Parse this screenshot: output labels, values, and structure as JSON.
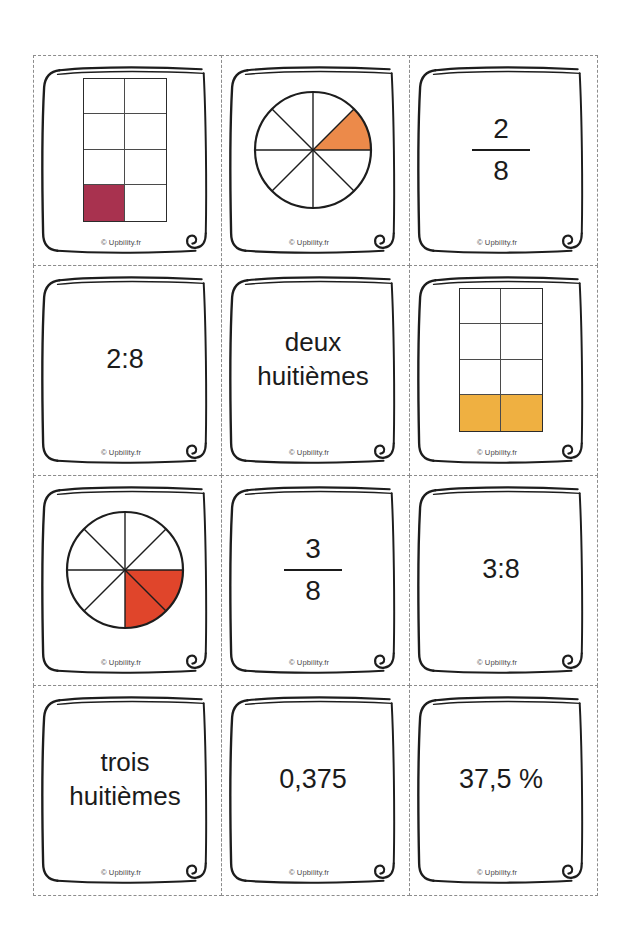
{
  "page": {
    "copyright": "© Upbility.fr",
    "background": "#ffffff",
    "cut_guide_color": "#8d8d8d",
    "ink_color": "#1b1b1b"
  },
  "palette": {
    "maroon": "#A8324F",
    "grid_orange": "#EFB041",
    "pie_orange": "#EC8A4A",
    "pie_red": "#E0452B",
    "outline": "#2c2c2c"
  },
  "cards": [
    {
      "id": "card-1",
      "kind": "rect-model",
      "name": "rectangle-model-one-eighth",
      "model": {
        "cols": 2,
        "rows": 4,
        "total": 8,
        "filled": 1,
        "filled_cells": [
          6
        ],
        "fill_color": "#A8324F",
        "width": 82,
        "height": 142
      },
      "copyright": "© Upbility.fr"
    },
    {
      "id": "card-2",
      "kind": "pie-model",
      "name": "pie-model-one-eighth",
      "model": {
        "sectors": 8,
        "filled": 1,
        "filled_sectors": [
          7
        ],
        "fill_color": "#EC8A4A",
        "radius": 58
      },
      "copyright": "© Upbility.fr"
    },
    {
      "id": "card-3",
      "kind": "fraction",
      "name": "fraction-two-eighths",
      "numerator": "2",
      "denominator": "8",
      "copyright": "© Upbility.fr"
    },
    {
      "id": "card-4",
      "kind": "text",
      "name": "ratio-two-to-eight",
      "text": "2:8",
      "copyright": "© Upbility.fr"
    },
    {
      "id": "card-5",
      "kind": "text",
      "name": "words-deux-huitiemes",
      "text": "deux\nhuitièmes",
      "copyright": "© Upbility.fr"
    },
    {
      "id": "card-6",
      "kind": "rect-model",
      "name": "rectangle-model-two-eighths",
      "model": {
        "cols": 2,
        "rows": 4,
        "total": 8,
        "filled": 2,
        "filled_cells": [
          6,
          7
        ],
        "fill_color": "#EFB041",
        "width": 82,
        "height": 142
      },
      "copyright": "© Upbility.fr"
    },
    {
      "id": "card-7",
      "kind": "pie-model",
      "name": "pie-model-two-eighths",
      "model": {
        "sectors": 8,
        "filled": 2,
        "filled_sectors": [
          0,
          1
        ],
        "fill_color": "#E0452B",
        "radius": 58
      },
      "copyright": "© Upbility.fr"
    },
    {
      "id": "card-8",
      "kind": "fraction",
      "name": "fraction-three-eighths",
      "numerator": "3",
      "denominator": "8",
      "copyright": "© Upbility.fr"
    },
    {
      "id": "card-9",
      "kind": "text",
      "name": "ratio-three-to-eight",
      "text": "3:8",
      "copyright": "© Upbility.fr"
    },
    {
      "id": "card-10",
      "kind": "text",
      "name": "words-trois-huitiemes",
      "text": "trois\nhuitièmes",
      "copyright": "© Upbility.fr"
    },
    {
      "id": "card-11",
      "kind": "text",
      "name": "decimal-zero-375",
      "text": "0,375",
      "copyright": "© Upbility.fr"
    },
    {
      "id": "card-12",
      "kind": "text",
      "name": "percent-37-5",
      "text": "37,5 %",
      "copyright": "© Upbility.fr"
    }
  ]
}
